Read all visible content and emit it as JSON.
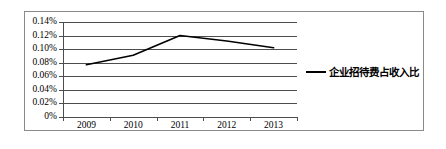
{
  "chart_data": {
    "type": "line",
    "title": "",
    "subtitle": "",
    "xlabel": "",
    "ylabel": "",
    "categories": [
      "2009",
      "2010",
      "2011",
      "2012",
      "2013"
    ],
    "series": [
      {
        "name": "企业招待费占收入比",
        "values": [
          0.077,
          0.091,
          0.12,
          0.112,
          0.102
        ],
        "color": "#000000"
      }
    ],
    "ylim": [
      0,
      0.14
    ],
    "y_ticks": [
      0.14,
      0.12,
      0.1,
      0.08,
      0.06,
      0.04,
      0.02,
      0
    ],
    "y_tick_labels": [
      "0.14%",
      "0.12%",
      "0.10%",
      "0.08%",
      "0.06%",
      "0.04%",
      "0.02%",
      "0%"
    ],
    "x_tick_labels": [
      "2009",
      "2010",
      "2011",
      "2012",
      "2013"
    ],
    "grid": "horizontal",
    "legend_position": "right",
    "legend_entries": [
      "企业招待费占收入比"
    ],
    "axis_color": "#4d4d4d",
    "border_color": "#8a8a8a",
    "background": "#ffffff"
  },
  "legend": {
    "label": "企业招待费占收入比"
  }
}
